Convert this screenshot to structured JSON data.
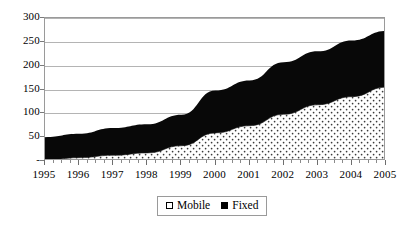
{
  "chart_data": {
    "type": "area",
    "stacked": true,
    "title": "",
    "subtitle": "",
    "xlabel": "",
    "ylabel": "",
    "categories": [
      "1995",
      "1996",
      "1997",
      "1998",
      "1999",
      "2000",
      "2001",
      "2002",
      "2003",
      "2004",
      "2005"
    ],
    "x": [
      1995,
      1996,
      1997,
      1998,
      1999,
      2000,
      2001,
      2002,
      2003,
      2004,
      2005
    ],
    "series": [
      {
        "name": "Mobile",
        "color": "#ffffff",
        "pattern": "dotted",
        "values": [
          2,
          7,
          12,
          17,
          32,
          59,
          74,
          98,
          118,
          135,
          155
        ]
      },
      {
        "name": "Fixed",
        "color": "#000000",
        "pattern": "solid",
        "values": [
          48,
          50,
          57,
          60,
          65,
          89,
          95,
          109,
          112,
          118,
          118
        ]
      }
    ],
    "totals": [
      50,
      57,
      69,
      77,
      97,
      148,
      169,
      207,
      230,
      253,
      273
    ],
    "ylim": [
      0,
      300
    ],
    "xlim": [
      1995,
      2005
    ],
    "ytick_labels": [
      "-",
      "50",
      "100",
      "150",
      "200",
      "250",
      "300"
    ],
    "ytick_values": [
      0,
      50,
      100,
      150,
      200,
      250,
      300
    ],
    "grid": true,
    "grid_axis": "y",
    "legend_position": "bottom-center",
    "legend_entries": [
      "Mobile",
      "Fixed"
    ]
  },
  "legend": {
    "mobile_label": "Mobile",
    "fixed_label": "Fixed"
  }
}
